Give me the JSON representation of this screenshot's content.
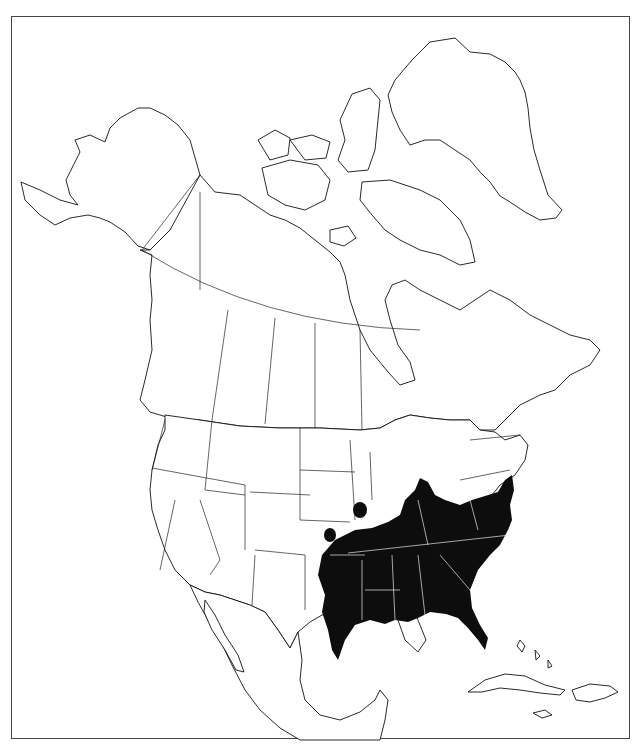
{
  "map": {
    "type": "species range map",
    "region": "North America",
    "projection_frame": "rectangular border",
    "colors": {
      "background": "#ffffff",
      "outline": "#111111",
      "range_fill": "#0d0d0d",
      "range_internal_borders": "#e8e8e8",
      "frame": "#444444"
    },
    "range": {
      "description": "Shaded distribution across the southeastern United States",
      "main_area": "Eastern Texas and Oklahoma east through Arkansas, Louisiana, Missouri (south), the Gulf states, Tennessee, Kentucky, southern Illinois/Indiana/Ohio, West Virginia, Virginia, the Carolinas, Georgia and Florida peninsula, north along the coast to New Jersey",
      "disjunct_patches": [
        "Isolated spot in central Kansas",
        "Isolated spot in southeastern Nebraska / northwestern Missouri"
      ]
    },
    "labels": []
  }
}
